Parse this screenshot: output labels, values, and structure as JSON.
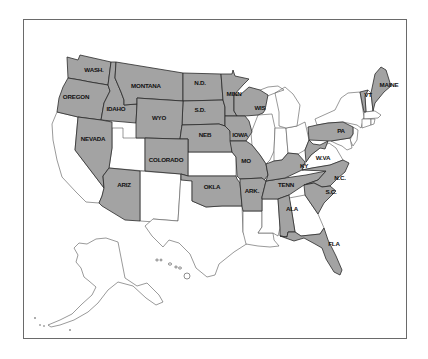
{
  "map": {
    "title": "",
    "legend": {
      "shaded_meaning": "highlighted state",
      "shaded_color": "#a3a3a3",
      "unshaded_color": "#ffffff",
      "border_color": "#2a2a2a"
    },
    "shaded_states": [
      {
        "code": "WA",
        "label": "WASH."
      },
      {
        "code": "OR",
        "label": "OREGON"
      },
      {
        "code": "ID",
        "label": "IDAHO"
      },
      {
        "code": "MT",
        "label": "MONTANA"
      },
      {
        "code": "ND",
        "label": "N.D."
      },
      {
        "code": "SD",
        "label": "S.D."
      },
      {
        "code": "MN",
        "label": "MINN"
      },
      {
        "code": "WI",
        "label": "WIS"
      },
      {
        "code": "WY",
        "label": "WYO"
      },
      {
        "code": "NE",
        "label": "NEB"
      },
      {
        "code": "IA",
        "label": "IOWA"
      },
      {
        "code": "NV",
        "label": "NEVADA"
      },
      {
        "code": "CO",
        "label": "COLORADO"
      },
      {
        "code": "MO",
        "label": "MO"
      },
      {
        "code": "AZ",
        "label": "ARIZ"
      },
      {
        "code": "OK",
        "label": "OKLA"
      },
      {
        "code": "AR",
        "label": "ARK."
      },
      {
        "code": "TN",
        "label": "TENN"
      },
      {
        "code": "KY",
        "label": "KY"
      },
      {
        "code": "WV",
        "label": "W.VA"
      },
      {
        "code": "PA",
        "label": "PA"
      },
      {
        "code": "VT",
        "label": "VT"
      },
      {
        "code": "ME",
        "label": "MAINE"
      },
      {
        "code": "NC",
        "label": "N.C."
      },
      {
        "code": "SC",
        "label": "S.C."
      },
      {
        "code": "AL",
        "label": "ALA"
      },
      {
        "code": "FL",
        "label": "FLA"
      }
    ],
    "unshaded_states": [
      "CA",
      "UT",
      "NM",
      "TX",
      "KS",
      "LA",
      "MS",
      "IL",
      "IN",
      "OH",
      "MI",
      "GA",
      "VA",
      "NY",
      "NH",
      "MA",
      "CT",
      "RI",
      "NJ",
      "DE",
      "MD",
      "AK",
      "HI"
    ]
  }
}
